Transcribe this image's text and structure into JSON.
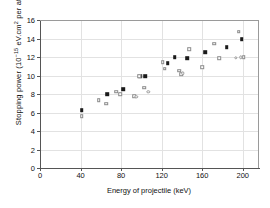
{
  "chart_data": {
    "type": "scatter",
    "title": "",
    "xlabel": "Energy of projectile (keV)",
    "ylabel_plain": "Stopping power (10-15 eV.cm2 per atom)",
    "ylabel_prefix": "Stopping power (10",
    "ylabel_exp": "−15",
    "ylabel_mid": " eV.cm",
    "ylabel_exp2": "2",
    "ylabel_suffix": " per atom)",
    "xlim": [
      0,
      215
    ],
    "ylim": [
      0,
      16
    ],
    "xticks": [
      0,
      40,
      80,
      120,
      160,
      200
    ],
    "yticks": [
      0,
      2,
      4,
      6,
      8,
      10,
      12,
      14,
      16
    ],
    "grid": true,
    "legend": "none",
    "series": [
      {
        "name": "filled-squares",
        "marker": "filled-square",
        "color": "#1a1a1a",
        "points": [
          {
            "x": 41,
            "y": 6.25
          },
          {
            "x": 66,
            "y": 7.95
          },
          {
            "x": 82,
            "y": 8.55
          },
          {
            "x": 99,
            "y": 9.95
          },
          {
            "x": 104,
            "y": 9.95
          },
          {
            "x": 126,
            "y": 11.35
          },
          {
            "x": 133,
            "y": 11.95
          },
          {
            "x": 145,
            "y": 11.9
          },
          {
            "x": 163,
            "y": 12.55
          },
          {
            "x": 184,
            "y": 13.05
          },
          {
            "x": 199,
            "y": 13.9
          }
        ]
      },
      {
        "name": "open-squares",
        "marker": "open-square",
        "color": "#8b8b8b",
        "points": [
          {
            "x": 41,
            "y": 5.6
          },
          {
            "x": 58,
            "y": 7.35
          },
          {
            "x": 65,
            "y": 6.95
          },
          {
            "x": 75,
            "y": 8.25
          },
          {
            "x": 79,
            "y": 7.95
          },
          {
            "x": 93,
            "y": 7.75
          },
          {
            "x": 98,
            "y": 9.95
          },
          {
            "x": 103,
            "y": 8.7
          },
          {
            "x": 121,
            "y": 11.45
          },
          {
            "x": 123,
            "y": 10.75
          },
          {
            "x": 137,
            "y": 10.5
          },
          {
            "x": 139,
            "y": 10.15
          },
          {
            "x": 147,
            "y": 12.85
          },
          {
            "x": 160,
            "y": 10.9
          },
          {
            "x": 172,
            "y": 13.45
          },
          {
            "x": 177,
            "y": 11.9
          },
          {
            "x": 196,
            "y": 14.75
          },
          {
            "x": 201,
            "y": 11.95
          }
        ]
      },
      {
        "name": "open-circles",
        "marker": "open-circle",
        "color": "#9a9a9a",
        "points": [
          {
            "x": 95,
            "y": 7.7
          },
          {
            "x": 107,
            "y": 8.25
          },
          {
            "x": 141,
            "y": 10.25
          },
          {
            "x": 193,
            "y": 11.9
          },
          {
            "x": 198,
            "y": 11.95
          }
        ]
      }
    ]
  },
  "axes": {
    "y_tick_labels": [
      "0",
      "2",
      "4",
      "6",
      "8",
      "10",
      "12",
      "14",
      "16"
    ],
    "x_tick_labels": [
      "0",
      "40",
      "80",
      "120",
      "160",
      "200"
    ]
  }
}
